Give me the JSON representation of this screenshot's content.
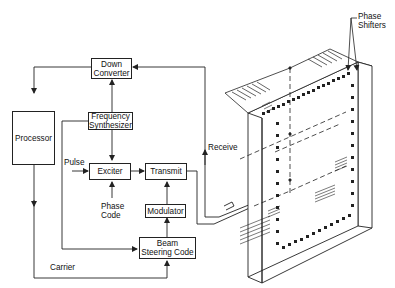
{
  "diagram": {
    "title": "",
    "blocks": {
      "down_converter": {
        "line1": "Down",
        "line2": "Converter"
      },
      "frequency_synthesizer": {
        "line1": "Frequency",
        "line2": "Synthesizer"
      },
      "processor": {
        "label": "Processor"
      },
      "exciter": {
        "label": "Exciter"
      },
      "transmit": {
        "label": "Transmit"
      },
      "modulator": {
        "label": "Modulator"
      },
      "beam_steering_code": {
        "line1": "Beam",
        "line2": "Steering Code"
      }
    },
    "labels": {
      "pulse": "Pulse",
      "phase_code_line1": "Phase",
      "phase_code_line2": "Code",
      "receive": "Receive",
      "carrier": "Carrier",
      "phase_shifters_line1": "Phase",
      "phase_shifters_line2": "Shifters"
    },
    "connections": [
      {
        "from": "Down Converter",
        "to": "Processor"
      },
      {
        "from": "Frequency Synthesizer",
        "to": "Down Converter"
      },
      {
        "from": "Frequency Synthesizer",
        "to": "Exciter"
      },
      {
        "from": "Frequency Synthesizer",
        "to": "Beam Steering Code"
      },
      {
        "from": "Pulse",
        "to": "Exciter"
      },
      {
        "from": "Phase Code",
        "to": "Exciter"
      },
      {
        "from": "Exciter",
        "to": "Transmit"
      },
      {
        "from": "Modulator",
        "to": "Transmit"
      },
      {
        "from": "Beam Steering Code",
        "to": "Modulator"
      },
      {
        "from": "Processor",
        "to": "Beam Steering Code",
        "label": "Carrier"
      },
      {
        "from": "Transmit",
        "to": "Phased Array"
      },
      {
        "from": "Phased Array",
        "to": "Down Converter",
        "label": "Receive"
      }
    ],
    "colors": {
      "line": "#222222",
      "background": "#ffffff"
    }
  }
}
